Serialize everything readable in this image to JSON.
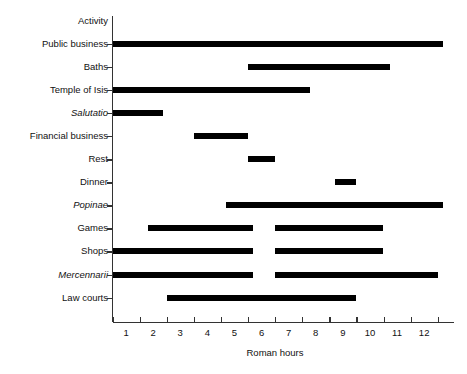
{
  "chart_data": {
    "type": "bar",
    "orientation": "horizontal-gantt",
    "title": "",
    "xlabel": "Roman hours",
    "ylabel": "Activity",
    "xlim": [
      0,
      12.6
    ],
    "ylim_categories": 12,
    "grid": false,
    "legend": null,
    "xticklabels": [
      "1",
      "2",
      "3",
      "4",
      "5",
      "6",
      "7",
      "8",
      "9",
      "10",
      "11",
      "12"
    ],
    "xtick_boundaries": [
      0,
      1,
      2,
      3,
      4,
      5,
      6,
      7,
      8,
      9,
      10,
      11,
      12
    ],
    "bar_color": "#000000",
    "axis_color": "#333333",
    "categories": [
      "Public business",
      "Baths",
      "Temple of Isis",
      "Salutatio",
      "Financial business",
      "Rest",
      "Dinner",
      "Popinae",
      "Games",
      "Shops",
      "Mercennarii",
      "Law courts"
    ],
    "categories_italic": [
      "Salutatio",
      "Popinae",
      "Mercennarii"
    ],
    "series": [
      {
        "name": "Public business",
        "intervals": [
          [
            0.0,
            12.2
          ]
        ]
      },
      {
        "name": "Baths",
        "intervals": [
          [
            5.0,
            10.25
          ]
        ]
      },
      {
        "name": "Temple of Isis",
        "intervals": [
          [
            0.0,
            7.3
          ]
        ]
      },
      {
        "name": "Salutatio",
        "intervals": [
          [
            0.0,
            1.85
          ]
        ]
      },
      {
        "name": "Financial business",
        "intervals": [
          [
            3.0,
            5.0
          ]
        ]
      },
      {
        "name": "Rest",
        "intervals": [
          [
            5.0,
            6.0
          ]
        ]
      },
      {
        "name": "Dinner",
        "intervals": [
          [
            8.2,
            9.0
          ]
        ]
      },
      {
        "name": "Popinae",
        "intervals": [
          [
            4.2,
            12.2
          ]
        ]
      },
      {
        "name": "Games",
        "intervals": [
          [
            1.3,
            5.2
          ],
          [
            6.0,
            10.0
          ]
        ]
      },
      {
        "name": "Shops",
        "intervals": [
          [
            0.0,
            5.2
          ],
          [
            6.0,
            10.0
          ]
        ]
      },
      {
        "name": "Mercennarii",
        "intervals": [
          [
            0.0,
            5.2
          ],
          [
            6.0,
            12.0
          ]
        ]
      },
      {
        "name": "Law courts",
        "intervals": [
          [
            2.0,
            9.0
          ]
        ]
      }
    ]
  }
}
